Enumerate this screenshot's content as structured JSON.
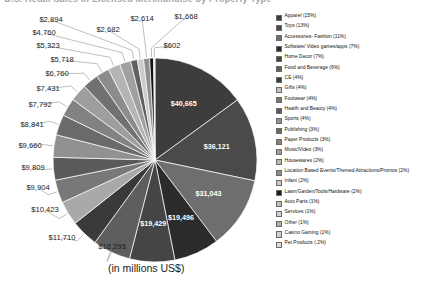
{
  "title": "U.S. Retail Sales of Licensed Merchandise by Property Type",
  "caption": "(in millions US$)",
  "chart_data": {
    "type": "pie",
    "title": "U.S. Retail Sales of Licensed Merchandise by Property Type",
    "subtitle": "(in millions US$)",
    "units": "millions US$",
    "legend_position": "right",
    "grid": false,
    "categories": [
      "Apparel",
      "Toys",
      "Accessories- Fashion",
      "Software/ Video games/apps",
      "Home Decor",
      "Food and Beverage",
      "CE",
      "Gifts",
      "Footwear",
      "Health and Beauty",
      "Sports",
      "Publishing",
      "Paper Products",
      "Music/Video",
      "Housewares",
      "Location Based Events/Themed Attractions/Promos",
      "Infant",
      "Lawn/Garden/Tools/Hardware",
      "Auto Parts",
      "Services",
      "Other",
      "Casino Gaming",
      "Pet Products"
    ],
    "values": [
      40665,
      36121,
      31043,
      19496,
      19429,
      16293,
      11710,
      10423,
      9904,
      9809,
      9660,
      8841,
      7792,
      7431,
      6760,
      5718,
      5323,
      4760,
      2894,
      2682,
      2614,
      1668,
      602
    ],
    "percents": [
      "15%",
      "13%",
      "11%",
      "7%",
      "7%",
      "6%",
      "4%",
      "4%",
      "4%",
      "4%",
      "4%",
      "3%",
      "3%",
      "3%",
      "2%",
      "2%",
      "2%",
      "2%",
      "1%",
      "1%",
      "1%",
      "1%",
      ".2%"
    ],
    "value_labels": [
      "$40,665",
      "$36,121",
      "$31,043",
      "$19,496",
      "$19,429",
      "$16,293",
      "$11,710",
      "$10,423",
      "$9,904",
      "$9,809",
      "$9,660",
      "$8,841",
      "$7,792",
      "$7,431",
      "$6,760",
      "$5,718",
      "$5,323",
      "$4,760",
      "$2,894",
      "$2,682",
      "$2,614",
      "$1,668",
      "$602"
    ],
    "colors": [
      "#3d3d3d",
      "#4a4a4a",
      "#6e6e6e",
      "#2b2b2b",
      "#454545",
      "#5e5e5e",
      "#3a3a3a",
      "#a9a9a9",
      "#787878",
      "#5a5a5a",
      "#919191",
      "#6a6a6a",
      "#828282",
      "#9e9e9e",
      "#717171",
      "#8c8c8c",
      "#b4b4b4",
      "#a0a0a0",
      "#606060",
      "#cccccc",
      "#8f8f8f",
      "#111111",
      "#d4d4d4"
    ],
    "inside_labeled": [
      "$40,665",
      "$36,121",
      "$31,043",
      "$19,496",
      "$19,429"
    ],
    "leader_labeled": [
      "$16,293",
      "$11,710",
      "$10,423",
      "$9,904",
      "$9,809",
      "$9,660",
      "$8,841",
      "$7,792",
      "$7,431",
      "$6,760",
      "$5,718",
      "$5,323",
      "$4,760",
      "$2,894",
      "$2,682",
      "$2,614",
      "$1,668",
      "$602"
    ]
  },
  "legend": {
    "items": [
      {
        "label": "Apparel (15%)",
        "color": "#3d3d3d"
      },
      {
        "label": "Toys (13%)",
        "color": "#4a4a4a"
      },
      {
        "label": "Accessories- Fashion (11%)",
        "color": "#6e6e6e"
      },
      {
        "label": "Software/ Video games/apps (7%)",
        "color": "#2b2b2b"
      },
      {
        "label": "Home Decor (7%)",
        "color": "#454545"
      },
      {
        "label": "Food and Beverage (6%)",
        "color": "#5e5e5e"
      },
      {
        "label": "CE (4%)",
        "color": "#3a3a3a"
      },
      {
        "label": "Gifts (4%)",
        "color": "#c3c3c3"
      },
      {
        "label": "Footwear (4%)",
        "color": "#787878"
      },
      {
        "label": "Health and Beauty (4%)",
        "color": "#5a5a5a"
      },
      {
        "label": "Sports (4%)",
        "color": "#919191"
      },
      {
        "label": "Publishing (3%)",
        "color": "#6a6a6a"
      },
      {
        "label": "Paper Products (3%)",
        "color": "#828282"
      },
      {
        "label": "Music/Video (3%)",
        "color": "#9e9e9e"
      },
      {
        "label": "Housewares (2%)",
        "color": "#b9b9b9"
      },
      {
        "label": "Location Based Events/Themed Attractions/Promos (2%)",
        "color": "#8c8c8c"
      },
      {
        "label": "Infant (2%)",
        "color": "#c9c9c9"
      },
      {
        "label": "Lawn/Garden/Tools/Hardware (2%)",
        "color": "#1c1c1c"
      },
      {
        "label": "Auto Parts (1%)",
        "color": "#bdbdbd"
      },
      {
        "label": "Services (1%)",
        "color": "#d0d0d0"
      },
      {
        "label": "Other (1%)",
        "color": "#b0b0b0"
      },
      {
        "label": "Casino Gaming (1%)",
        "color": "#cfcfcf"
      },
      {
        "label": "Pet Products (.2%)",
        "color": "#dcdcdc"
      }
    ]
  }
}
